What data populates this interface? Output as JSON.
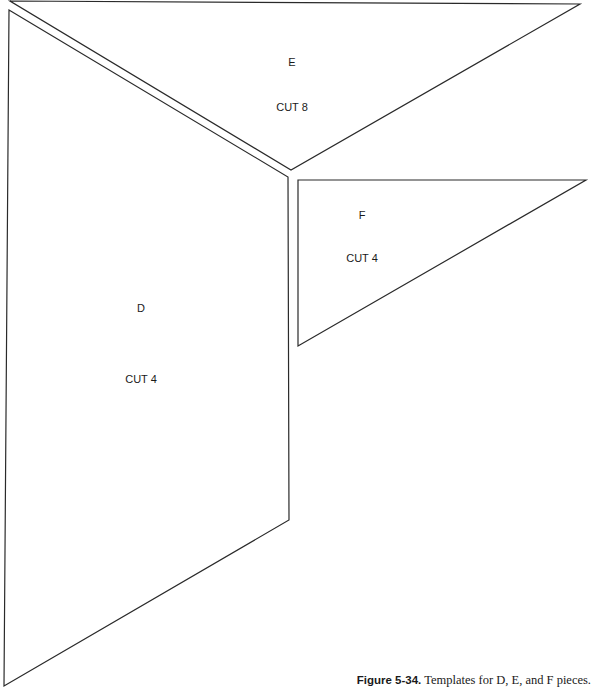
{
  "pieces": [
    {
      "id": "E",
      "letter": "E",
      "instruction": "CUT 8",
      "points": "10,1 580,4 291,170",
      "letter_pos": {
        "x": 292,
        "y": 56
      },
      "instruction_pos": {
        "x": 292,
        "y": 101
      }
    },
    {
      "id": "D",
      "letter": "D",
      "instruction": "CUT 4",
      "points": "9,10 288,177 289,520 4,686",
      "letter_pos": {
        "x": 141,
        "y": 302
      },
      "instruction_pos": {
        "x": 141,
        "y": 373
      }
    },
    {
      "id": "F",
      "letter": "F",
      "instruction": "CUT 4",
      "points": "298,180 586,180 298,346",
      "letter_pos": {
        "x": 362,
        "y": 209
      },
      "instruction_pos": {
        "x": 362,
        "y": 252
      }
    }
  ],
  "line_color": "#2a2a2a",
  "caption": {
    "figure_number": "Figure 5-34.",
    "text": " Templates for D, E, and F pieces."
  }
}
